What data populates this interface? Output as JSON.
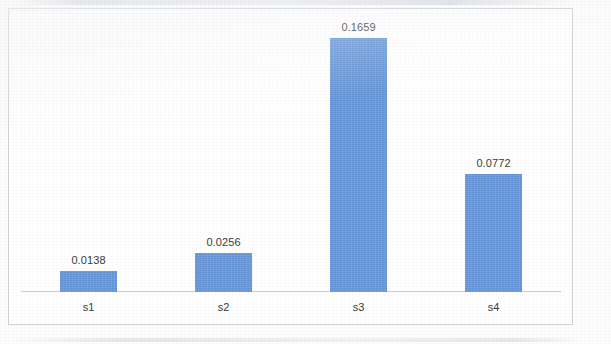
{
  "chart_data": {
    "type": "bar",
    "title": "",
    "subtitle": "",
    "xlabel": "",
    "ylabel": "",
    "categories": [
      "s1",
      "s2",
      "s3",
      "s4"
    ],
    "values": [
      0.0138,
      0.0256,
      0.1659,
      0.0772
    ],
    "data_labels": [
      "0.0138",
      "0.0256",
      "0.1659",
      "0.0772"
    ],
    "ylim": [
      0,
      0.1848
    ],
    "grid": false,
    "y_axis_labels_visible": false,
    "legend": null,
    "legend_position": "none",
    "series": [
      {
        "name": "Series 1",
        "color": "#6699dd",
        "values": [
          0.0138,
          0.0256,
          0.1659,
          0.0772
        ]
      }
    ],
    "colors": {
      "bar": "#6699dd",
      "axis_line": "#c8ccd2",
      "frame_border": "#cfd2d6",
      "label_text": "#3a3a3a",
      "plot_background": "#ffffff"
    }
  }
}
